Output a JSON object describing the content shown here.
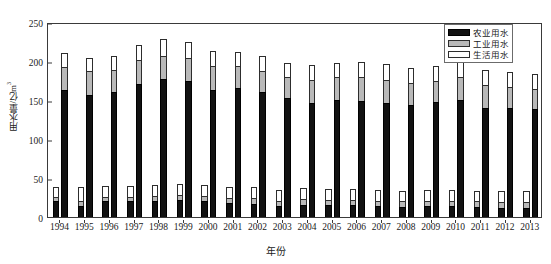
{
  "chart_data": {
    "type": "bar",
    "title": "",
    "xlabel": "年份",
    "ylabel": "用水量/亿m³",
    "ylim": [
      0,
      250
    ],
    "yticks": [
      0,
      50,
      100,
      150,
      200,
      250
    ],
    "grid": false,
    "legend_position": "top-right",
    "stacked": true,
    "grouped": true,
    "categories": [
      "1994",
      "1995",
      "1996",
      "1997",
      "1998",
      "1999",
      "2000",
      "2001",
      "2002",
      "2003",
      "2004",
      "2005",
      "2006",
      "2007",
      "2008",
      "2009",
      "2010",
      "2011",
      "2012",
      "2013"
    ],
    "groups": [
      {
        "name": "短柱",
        "series": [
          {
            "name": "农业用水",
            "color": "#121212",
            "values": [
              20,
              14,
              20,
              20,
              21,
              22,
              20,
              18,
              17,
              14,
              16,
              15,
              15,
              14,
              13,
              14,
              14,
              13,
              12,
              12
            ]
          },
          {
            "name": "工业用水",
            "color": "#b9b9b9",
            "values": [
              6,
              7,
              6,
              6,
              6,
              6,
              7,
              7,
              7,
              7,
              7,
              7,
              7,
              7,
              7,
              7,
              7,
              7,
              7,
              7
            ]
          },
          {
            "name": "生活用水",
            "color": "#ffffff",
            "values": [
              13,
              18,
              14,
              14,
              14,
              14,
              14,
              14,
              14,
              14,
              14,
              14,
              14,
              14,
              14,
              14,
              14,
              14,
              14,
              14
            ]
          }
        ]
      },
      {
        "name": "高柱",
        "series": [
          {
            "name": "农业用水",
            "color": "#121212",
            "values": [
              163,
              157,
              160,
              171,
              177,
              174,
              163,
              165,
              160,
              152,
              146,
              150,
              149,
              146,
              144,
              147,
              150,
              140,
              140,
              139
            ]
          },
          {
            "name": "工业用水",
            "color": "#b9b9b9",
            "values": [
              29,
              30,
              28,
              30,
              30,
              30,
              30,
              28,
              27,
              28,
              30,
              29,
              30,
              30,
              28,
              28,
              29,
              29,
              27,
              25
            ]
          },
          {
            "name": "生活用水",
            "color": "#ffffff",
            "values": [
              18,
              17,
              18,
              20,
              21,
              20,
              20,
              19,
              19,
              18,
              19,
              19,
              20,
              20,
              19,
              19,
              20,
              20,
              19,
              19
            ]
          }
        ]
      }
    ],
    "legend": [
      {
        "key": "agri",
        "label": "农业用水",
        "color": "#121212"
      },
      {
        "key": "indus",
        "label": "工业用水",
        "color": "#b9b9b9"
      },
      {
        "key": "dom",
        "label": "生活用水",
        "color": "#ffffff"
      }
    ]
  }
}
